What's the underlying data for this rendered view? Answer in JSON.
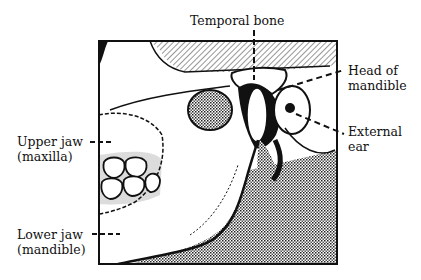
{
  "diagram": {
    "type": "anatomical-illustration",
    "labels": {
      "temporal_bone": "Temporal bone",
      "head_of_mandible_line1": "Head of",
      "head_of_mandible_line2": "mandible",
      "external_ear_line1": "External",
      "external_ear_line2": "ear",
      "upper_jaw_line1": "Upper jaw",
      "upper_jaw_line2": "(maxilla)",
      "lower_jaw_line1": "Lower jaw",
      "lower_jaw_line2": "(mandible)"
    },
    "colors": {
      "ink": "#111111",
      "background": "#ffffff",
      "stipple": "#9a9a9a"
    }
  }
}
